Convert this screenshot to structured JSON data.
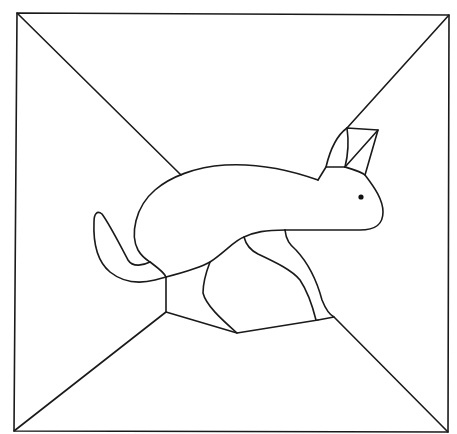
{
  "figure": {
    "stroke_color": "#1a1a1a",
    "background": "#ffffff",
    "frame": {
      "corners": {
        "top_left": [
          17,
          13
        ],
        "top_right": [
          449,
          15
        ],
        "bottom_right": [
          448,
          432
        ],
        "bottom_left": [
          14,
          431
        ]
      }
    },
    "parts": [
      "frame",
      "corner-line-top-left",
      "corner-line-top-right",
      "corner-line-bottom-left",
      "corner-line-bottom-right",
      "hare-body",
      "hare-ear",
      "hare-head",
      "hare-eye",
      "hare-tail",
      "hare-hind-leg",
      "hare-front-leg"
    ]
  }
}
